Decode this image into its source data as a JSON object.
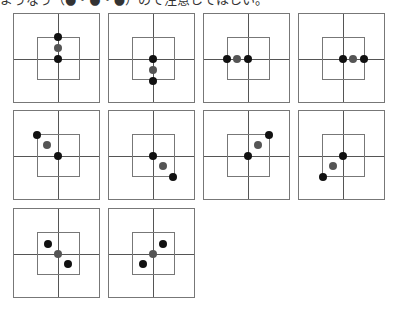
{
  "caption": "ようなう（●・●・●）ので注意してほしい。",
  "colors": {
    "dot_black": "#111111",
    "dot_gray": "#555555",
    "line": "#777777"
  },
  "panels": [
    {
      "id": 1,
      "x": 13,
      "y": 13,
      "dots": [
        {
          "dx": 0,
          "dy": -22,
          "c": "black"
        },
        {
          "dx": 0,
          "dy": -11,
          "c": "gray"
        },
        {
          "dx": 0,
          "dy": 0,
          "c": "black"
        }
      ]
    },
    {
      "id": 2,
      "x": 108,
      "y": 13,
      "dots": [
        {
          "dx": 0,
          "dy": 0,
          "c": "black"
        },
        {
          "dx": 0,
          "dy": 11,
          "c": "gray"
        },
        {
          "dx": 0,
          "dy": 22,
          "c": "black"
        }
      ]
    },
    {
      "id": 3,
      "x": 203,
      "y": 13,
      "dots": [
        {
          "dx": -21,
          "dy": 0,
          "c": "black"
        },
        {
          "dx": -11,
          "dy": 0,
          "c": "gray"
        },
        {
          "dx": 0,
          "dy": 0,
          "c": "black"
        }
      ]
    },
    {
      "id": 4,
      "x": 298,
      "y": 13,
      "dots": [
        {
          "dx": 0,
          "dy": 0,
          "c": "black"
        },
        {
          "dx": 10,
          "dy": 0,
          "c": "gray"
        },
        {
          "dx": 21,
          "dy": 0,
          "c": "black"
        }
      ]
    },
    {
      "id": 5,
      "x": 13,
      "y": 110,
      "dots": [
        {
          "dx": -21,
          "dy": -21,
          "c": "black"
        },
        {
          "dx": -11,
          "dy": -11,
          "c": "gray"
        },
        {
          "dx": 0,
          "dy": 0,
          "c": "black"
        }
      ]
    },
    {
      "id": 6,
      "x": 108,
      "y": 110,
      "dots": [
        {
          "dx": 0,
          "dy": 0,
          "c": "black"
        },
        {
          "dx": 10,
          "dy": 10,
          "c": "gray"
        },
        {
          "dx": 20,
          "dy": 21,
          "c": "black"
        }
      ]
    },
    {
      "id": 7,
      "x": 203,
      "y": 110,
      "dots": [
        {
          "dx": 0,
          "dy": 0,
          "c": "black"
        },
        {
          "dx": 10,
          "dy": -11,
          "c": "gray"
        },
        {
          "dx": 21,
          "dy": -21,
          "c": "black"
        }
      ]
    },
    {
      "id": 8,
      "x": 298,
      "y": 110,
      "dots": [
        {
          "dx": 0,
          "dy": 0,
          "c": "black"
        },
        {
          "dx": -10,
          "dy": 10,
          "c": "gray"
        },
        {
          "dx": -20,
          "dy": 21,
          "c": "black"
        }
      ]
    },
    {
      "id": 9,
      "x": 13,
      "y": 208,
      "dots": [
        {
          "dx": -10,
          "dy": -10,
          "c": "black"
        },
        {
          "dx": 0,
          "dy": 0,
          "c": "gray"
        },
        {
          "dx": 10,
          "dy": 10,
          "c": "black"
        }
      ]
    },
    {
      "id": 10,
      "x": 108,
      "y": 208,
      "dots": [
        {
          "dx": 10,
          "dy": -10,
          "c": "black"
        },
        {
          "dx": 0,
          "dy": 0,
          "c": "gray"
        },
        {
          "dx": -10,
          "dy": 10,
          "c": "black"
        }
      ]
    }
  ]
}
